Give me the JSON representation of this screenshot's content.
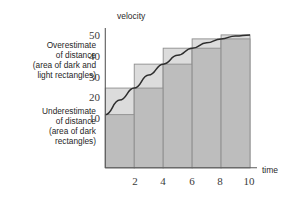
{
  "chart_data": {
    "type": "bar",
    "title": "",
    "subtitle": "",
    "xlabel": "time",
    "ylabel": "velocity",
    "xlim": [
      0,
      10
    ],
    "ylim": [
      0,
      52
    ],
    "grid": false,
    "legend_position": "none",
    "x_ticks": [
      "2",
      "4",
      "6",
      "8",
      "10"
    ],
    "x_tick_values": [
      2,
      4,
      6,
      8,
      10
    ],
    "y_ticks": [
      "10",
      "20",
      "30",
      "40",
      "50"
    ],
    "y_tick_values": [
      10,
      20,
      30,
      40,
      50
    ],
    "categories": [
      "0-2",
      "2-4",
      "4-6",
      "6-8",
      "8-10"
    ],
    "bar_intervals": [
      [
        0,
        2
      ],
      [
        2,
        4
      ],
      [
        4,
        6
      ],
      [
        6,
        8
      ],
      [
        8,
        10
      ]
    ],
    "series": [
      {
        "name": "Overestimate (area of dark and light rectangles)",
        "fill": "#dcdcdc",
        "values": [
          30,
          39,
          45,
          48.5,
          50
        ]
      },
      {
        "name": "Underestimate (area of dark rectangles)",
        "fill": "#bdbdbd",
        "values": [
          20,
          30,
          39,
          45,
          48.5
        ]
      }
    ],
    "curve": {
      "name": "velocity curve",
      "color": "#2e2e2e",
      "points": [
        [
          0,
          20
        ],
        [
          1,
          25.5
        ],
        [
          2,
          30
        ],
        [
          3,
          34.9
        ],
        [
          4,
          39
        ],
        [
          5,
          42.3
        ],
        [
          6,
          45
        ],
        [
          7,
          47
        ],
        [
          8,
          48.5
        ],
        [
          9,
          49.6
        ],
        [
          10,
          50
        ]
      ]
    },
    "annotations": [
      {
        "id": "overestimate-note",
        "lines": [
          "Overestimate",
          "of distance",
          "(area of dark and",
          "light rectangles)"
        ],
        "align": "right"
      },
      {
        "id": "underestimate-note",
        "lines": [
          "Underestimate",
          "of distance",
          "(area of dark",
          "rectangles)"
        ],
        "align": "right"
      }
    ]
  },
  "axes": {
    "x_title": "time",
    "y_title": "velocity"
  }
}
